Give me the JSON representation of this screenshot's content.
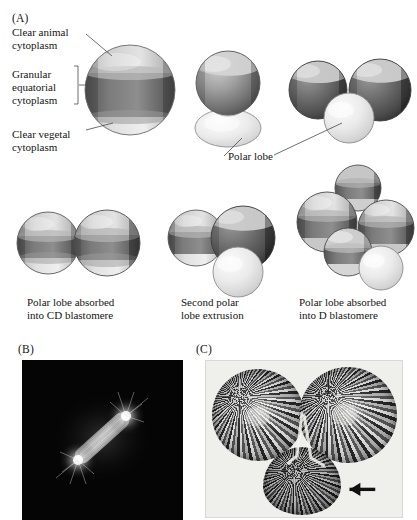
{
  "figure": {
    "panels": [
      {
        "id": "A",
        "letter": "(A)"
      },
      {
        "id": "B",
        "letter": "(B)"
      },
      {
        "id": "C",
        "letter": "(C)"
      }
    ]
  },
  "panel_a": {
    "annotations": [
      {
        "name": "clear-animal-cytoplasm",
        "text": "Clear animal\ncytoplasm"
      },
      {
        "name": "granular-equatorial-cytoplasm",
        "text": "Granular\nequatorial\ncytoplasm"
      },
      {
        "name": "clear-vegetal-cytoplasm",
        "text": "Clear vegetal\ncytoplasm"
      },
      {
        "name": "polar-lobe",
        "text": "Polar lobe"
      }
    ],
    "cell_labels": {
      "ab_top": "AB",
      "cd_top": "CD",
      "ab_bottom_left": "AB",
      "cd_bottom_left": "CD",
      "ab_bottom_middle": "AB",
      "cd_bottom_middle": "CD",
      "a": "A",
      "b": "B",
      "c": "C",
      "d": "D"
    },
    "captions": [
      {
        "name": "caption-polar-lobe-absorbed-cd",
        "text": "Polar lobe absorbed\ninto CD blastomere"
      },
      {
        "name": "caption-second-polar-lobe-extrusion",
        "text": "Second polar\nlobe extrusion"
      },
      {
        "name": "caption-polar-lobe-absorbed-d",
        "text": "Polar lobe absorbed\ninto D blastomere"
      }
    ]
  },
  "panel_b": {
    "description": "fluorescence micrograph of mitotic spindle with asters on black field"
  },
  "panel_c": {
    "description": "light micrograph of two-cell embryo with polar lobe",
    "arrow_name": "polar-lobe-arrow"
  },
  "colors": {
    "background": "#ffffff",
    "text": "#141414",
    "animal_clear": "#c8c8c8",
    "granular_dark": "#6f6f6f",
    "vegetal_clear": "#dedede",
    "polar_lobe_light": "#e6e6e4",
    "leader_line": "#4a4a4a",
    "micrograph_b_background": "#050505",
    "micrograph_c_background": "#efefec"
  }
}
